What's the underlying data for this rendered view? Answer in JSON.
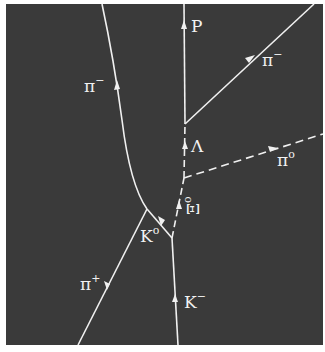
{
  "diagram": {
    "background_color": "#3a3a3a",
    "track_color": "#f0f0f0",
    "frame": {
      "x": 6,
      "y": 4,
      "width": 317,
      "height": 341
    },
    "vertices": [
      {
        "id": "production",
        "x": 172,
        "y": 238
      },
      {
        "id": "K0_decay",
        "x": 147,
        "y": 209
      },
      {
        "id": "Xi0_decay",
        "x": 184,
        "y": 178
      },
      {
        "id": "Lambda_decay",
        "x": 185,
        "y": 124
      }
    ],
    "tracks": [
      {
        "particle": "K-",
        "label": "K",
        "sup": "−",
        "style": "solid",
        "charged": true
      },
      {
        "particle": "K0",
        "label": "K",
        "sup": "o",
        "style": "solid",
        "charged": false
      },
      {
        "particle": "Xi0",
        "label": "Ξ",
        "sup": "o",
        "style": "dashed",
        "charged": false
      },
      {
        "particle": "pi+",
        "label": "π",
        "sup": "+",
        "style": "solid",
        "charged": true
      },
      {
        "particle": "pi- (from K0)",
        "label": "π",
        "sup": "−",
        "style": "solid",
        "charged": true
      },
      {
        "particle": "pi0",
        "label": "π",
        "sup": "o",
        "style": "dashed",
        "charged": false
      },
      {
        "particle": "Lambda",
        "label": "Λ",
        "sup": "",
        "style": "dashed",
        "charged": false
      },
      {
        "particle": "P",
        "label": "P",
        "sup": "",
        "style": "solid",
        "charged": true
      },
      {
        "particle": "pi- (from Lambda)",
        "label": "π",
        "sup": "−",
        "style": "solid",
        "charged": true
      }
    ]
  }
}
